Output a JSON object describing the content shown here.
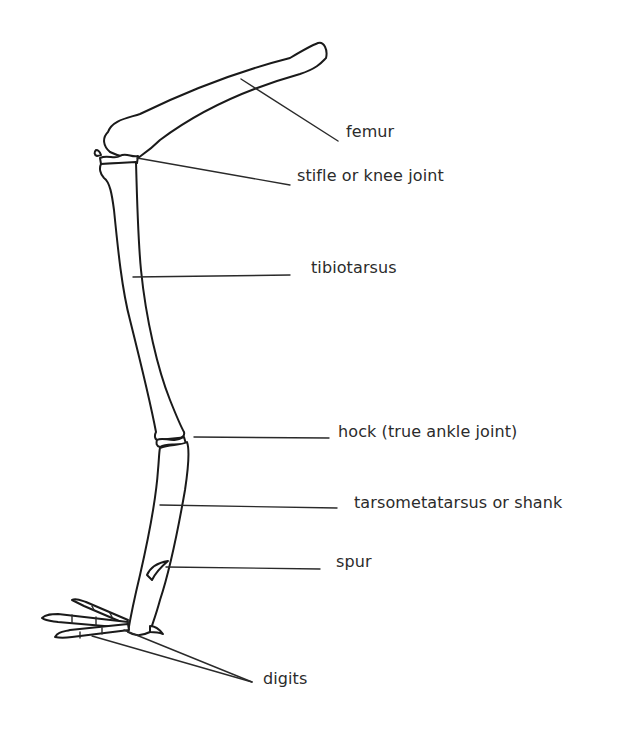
{
  "diagram": {
    "labels": [
      {
        "id": "femur",
        "text": "femur"
      },
      {
        "id": "stifle",
        "text": "stifle or knee joint"
      },
      {
        "id": "tibiotarsus",
        "text": "tibiotarsus"
      },
      {
        "id": "hock",
        "text": "hock (true ankle joint)"
      },
      {
        "id": "tarsometatarsus",
        "text": "tarsometatarsus or shank"
      },
      {
        "id": "spur",
        "text": "spur"
      },
      {
        "id": "digits",
        "text": "digits"
      }
    ],
    "colors": {
      "line": "#1a1a1a",
      "text": "#2b2b2b",
      "background": "#ffffff"
    }
  }
}
